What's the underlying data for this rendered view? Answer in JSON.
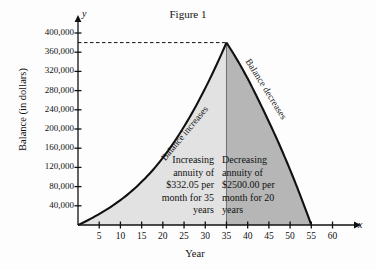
{
  "figure": {
    "title": "Figure 1",
    "x_axis_name": "x",
    "y_axis_name": "y"
  },
  "axes": {
    "xlabel": "Year",
    "ylabel": "Balance (in dollars)",
    "x_ticks": [
      "5",
      "10",
      "15",
      "20",
      "25",
      "30",
      "35",
      "40",
      "45",
      "50",
      "55",
      "60"
    ],
    "y_ticks": [
      "40,000",
      "80,000",
      "120,000",
      "160,000",
      "200,000",
      "240,000",
      "280,000",
      "320,000",
      "360,000",
      "400,000"
    ]
  },
  "curve_labels": {
    "increasing": "Balance increases",
    "decreasing": "Balance decreases"
  },
  "annotations": {
    "left": "Increasing\nannuity of\n$332.05\nper month\nfor 35 years",
    "right": "Decreasing\nannuity of\n$2500.00\nper month\nfor 20 years"
  },
  "colors": {
    "fill_left": "#e2e2e2",
    "fill_right": "#b6b6b6",
    "curve": "#111111",
    "axis": "#111111"
  },
  "chart_data": {
    "type": "area",
    "title": "Figure 1",
    "xlabel": "Year",
    "ylabel": "Balance (in dollars)",
    "xlim": [
      0,
      62
    ],
    "ylim": [
      0,
      410000
    ],
    "grid": false,
    "legend": false,
    "peak_year": 35,
    "peak_value": 380000,
    "end_year": 55,
    "dashed_reference_line": 380000,
    "series": [
      {
        "name": "Increasing annuity ($332.05/month, 35 years)",
        "phase": "accumulation",
        "x": [
          0,
          5,
          10,
          15,
          20,
          25,
          30,
          35
        ],
        "values": [
          0,
          23000,
          52000,
          90000,
          140000,
          205000,
          285000,
          380000
        ]
      },
      {
        "name": "Decreasing annuity ($2500.00/month, 20 years)",
        "phase": "payout",
        "x": [
          35,
          40,
          45,
          50,
          55
        ],
        "values": [
          380000,
          305000,
          215000,
          115000,
          0
        ]
      }
    ]
  }
}
